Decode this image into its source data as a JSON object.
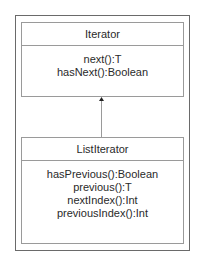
{
  "diagram": {
    "type": "uml-class",
    "classes": [
      {
        "name": "Iterator",
        "operations": [
          "next():T",
          "hasNext():Boolean"
        ]
      },
      {
        "name": "ListIterator",
        "operations": [
          "hasPrevious():Boolean",
          "previous():T",
          "nextIndex():Int",
          "previousIndex():Int"
        ]
      }
    ],
    "relationships": [
      {
        "from": "ListIterator",
        "to": "Iterator",
        "kind": "generalization"
      }
    ]
  }
}
